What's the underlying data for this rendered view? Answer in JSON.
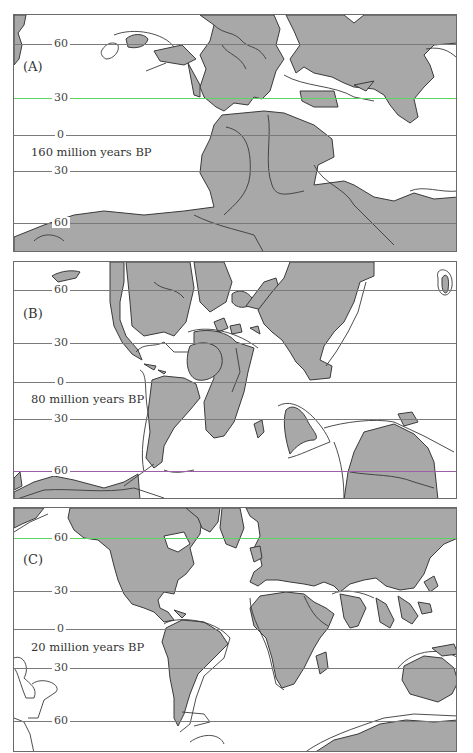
{
  "figure": {
    "land_color": "#a8a8a8",
    "ocean_color": "#ffffff",
    "outline_color": "#3a3a3a",
    "panels": [
      {
        "letter": "(A)",
        "caption": "160 million years BP",
        "latitudes": [
          {
            "label": "60",
            "y": 29,
            "color": "#7a7a7a"
          },
          {
            "label": "30",
            "y": 83,
            "color": "#5fd35f"
          },
          {
            "label": "0",
            "y": 120,
            "color": "#7a7a7a"
          },
          {
            "label": "30",
            "y": 156,
            "color": "#7a7a7a"
          },
          {
            "label": "60",
            "y": 208,
            "color": "#7a7a7a"
          }
        ]
      },
      {
        "letter": "(B)",
        "caption": "80 million years BP",
        "latitudes": [
          {
            "label": "60",
            "y": 28,
            "color": "#7a7a7a"
          },
          {
            "label": "30",
            "y": 81,
            "color": "#7a7a7a"
          },
          {
            "label": "0",
            "y": 120,
            "color": "#7a7a7a"
          },
          {
            "label": "30",
            "y": 157,
            "color": "#7a7a7a"
          },
          {
            "label": "60",
            "y": 209,
            "color": "#9b5fa6"
          }
        ]
      },
      {
        "letter": "(C)",
        "caption": "20 million years BP",
        "latitudes": [
          {
            "label": "60",
            "y": 30,
            "color": "#5fd35f"
          },
          {
            "label": "30",
            "y": 83,
            "color": "#7a7a7a"
          },
          {
            "label": "0",
            "y": 121,
            "color": "#7a7a7a"
          },
          {
            "label": "30",
            "y": 160,
            "color": "#7a7a7a"
          },
          {
            "label": "60",
            "y": 213,
            "color": "#7a7a7a"
          }
        ]
      }
    ]
  }
}
